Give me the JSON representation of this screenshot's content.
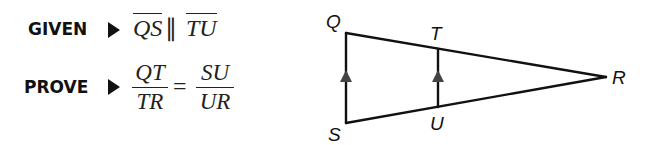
{
  "given": {
    "keyword": "GIVEN",
    "segment1": "QS",
    "relation": "∥",
    "segment2": "TU"
  },
  "prove": {
    "keyword": "PROVE",
    "left_num": "QT",
    "left_den": "TR",
    "equals": "=",
    "right_num": "SU",
    "right_den": "UR"
  },
  "diagram": {
    "labels": {
      "Q": "Q",
      "T": "T",
      "R": "R",
      "S": "S",
      "U": "U"
    },
    "points": {
      "Q": [
        346,
        33
      ],
      "S": [
        346,
        123
      ],
      "T": [
        438,
        49
      ],
      "U": [
        438,
        107
      ],
      "R": [
        606,
        77
      ]
    },
    "parallel_marks": "arrowheads on QS and TU",
    "line_color": "#111111"
  }
}
